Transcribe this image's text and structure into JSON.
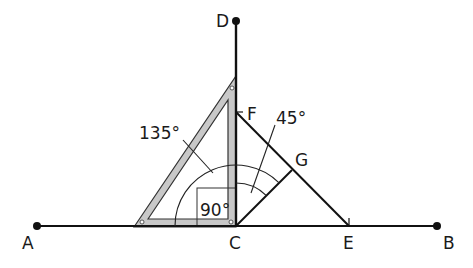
{
  "diagram": {
    "points": {
      "A": "A",
      "B": "B",
      "C": "C",
      "D": "D",
      "E": "E",
      "F": "F",
      "G": "G"
    },
    "angles": {
      "obtuse": "135°",
      "right": "90°",
      "acute": "45°"
    },
    "colors": {
      "line": "#111111",
      "set_square_fill": "#c8c8c8",
      "set_square_stroke": "#333333",
      "background": "#ffffff"
    }
  }
}
